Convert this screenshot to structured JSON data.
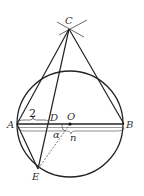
{
  "diagram": {
    "points": {
      "A": {
        "label": "A",
        "x": 17,
        "y": 124
      },
      "B": {
        "label": "B",
        "x": 124,
        "y": 124
      },
      "C": {
        "label": "C",
        "x": 69,
        "y": 29
      },
      "D": {
        "label": "D",
        "x": 49,
        "y": 124
      },
      "O": {
        "label": "O",
        "x": 70,
        "y": 124
      },
      "E": {
        "label": "E",
        "x": 38,
        "y": 169
      }
    },
    "circle": {
      "cx": 70,
      "cy": 124,
      "r": 53
    },
    "annotations": {
      "ad_length": "2",
      "angle_label": "α",
      "ab_label": "n"
    },
    "colors": {
      "stroke": "#222222",
      "label": "#333333"
    }
  }
}
